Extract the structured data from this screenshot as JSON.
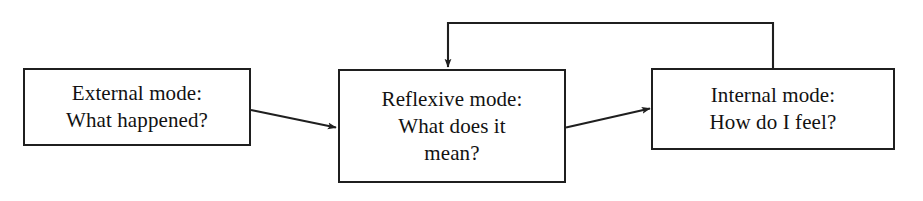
{
  "diagram": {
    "background_color": "#ffffff",
    "stroke_color": "#1f1f1f",
    "text_color": "#121212",
    "nodes": [
      {
        "id": "external",
        "name": "external-mode-box",
        "lines": [
          "External mode:",
          "What happened?"
        ]
      },
      {
        "id": "reflexive",
        "name": "reflexive-mode-box",
        "lines": [
          "Reflexive mode:",
          "What does it",
          "mean?"
        ]
      },
      {
        "id": "internal",
        "name": "internal-mode-box",
        "lines": [
          "Internal mode:",
          "How do I feel?"
        ]
      }
    ],
    "edges": [
      {
        "id": "external-to-reflexive",
        "name": "arrow-external-to-reflexive",
        "from": "external",
        "to": "reflexive",
        "style": "straight",
        "label": ""
      },
      {
        "id": "reflexive-to-internal",
        "name": "arrow-reflexive-to-internal",
        "from": "reflexive",
        "to": "internal",
        "style": "straight",
        "label": ""
      },
      {
        "id": "internal-to-reflexive",
        "name": "arrow-internal-to-reflexive-feedback",
        "from": "internal",
        "to": "reflexive",
        "style": "orthogonal-feedback-top",
        "label": ""
      }
    ]
  }
}
